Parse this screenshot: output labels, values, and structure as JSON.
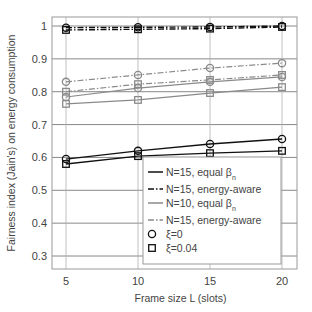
{
  "chart_data": {
    "type": "line",
    "title": "",
    "xlabel": "Frame size L (slots)",
    "ylabel": "Fairness index (Jain's) on energy consumption",
    "x": [
      5,
      10,
      15,
      20
    ],
    "xlim": [
      4,
      21
    ],
    "ylim": [
      0.26,
      1.03
    ],
    "xticks": [
      5,
      10,
      15,
      20
    ],
    "xtick_labels": [
      "5",
      "10",
      "15",
      "20"
    ],
    "yticks": [
      0.3,
      0.4,
      0.5,
      0.6,
      0.7,
      0.8,
      0.9,
      1.0
    ],
    "ytick_labels": [
      "0.3",
      "0.4",
      "0.5",
      "0.6",
      "0.7",
      "0.8",
      "0.9",
      "1"
    ],
    "grid": true,
    "legend_position": "bottom-right",
    "series": [
      {
        "name": "N=15, equal βn, ξ=0",
        "group": "N=15, equal βn",
        "marker": "circle",
        "color": "#111111",
        "dash": "solid",
        "values": [
          0.595,
          0.62,
          0.641,
          0.656
        ]
      },
      {
        "name": "N=15, equal βn, ξ=0.04",
        "group": "N=15, equal βn",
        "marker": "square",
        "color": "#111111",
        "dash": "solid",
        "values": [
          0.58,
          0.604,
          0.613,
          0.62
        ]
      },
      {
        "name": "N=15, energy-aware, ξ=0",
        "group": "N=15, energy-aware",
        "marker": "circle",
        "color": "#111111",
        "dash": "dashdot",
        "values": [
          0.995,
          0.996,
          0.997,
          1.0
        ]
      },
      {
        "name": "N=15, energy-aware, ξ=0.04",
        "group": "N=15, energy-aware",
        "marker": "square",
        "color": "#111111",
        "dash": "dashdot",
        "values": [
          0.988,
          0.99,
          0.992,
          0.997
        ]
      },
      {
        "name": "N=10, equal βn, ξ=0",
        "group": "N=10, equal βn",
        "marker": "circle",
        "color": "#8a8a8a",
        "dash": "solid",
        "values": [
          0.784,
          0.811,
          0.83,
          0.845
        ]
      },
      {
        "name": "N=10, equal βn, ξ=0.04",
        "group": "N=10, equal βn",
        "marker": "square",
        "color": "#8a8a8a",
        "dash": "solid",
        "values": [
          0.763,
          0.775,
          0.796,
          0.814
        ]
      },
      {
        "name": "N=15, energy-aware (gray), ξ=0",
        "group": "N=15, energy-aware (gray)",
        "marker": "circle",
        "color": "#8a8a8a",
        "dash": "dashdot",
        "values": [
          0.83,
          0.851,
          0.872,
          0.887
        ]
      },
      {
        "name": "N=15, energy-aware (gray), ξ=0.04",
        "group": "N=15, energy-aware (gray)",
        "marker": "square",
        "color": "#8a8a8a",
        "dash": "dashdot",
        "values": [
          0.8,
          0.823,
          0.836,
          0.851
        ]
      }
    ],
    "legend": [
      {
        "label": "N=15, equal β",
        "sub": "n",
        "kind": "line",
        "color": "#111111",
        "dash": "solid"
      },
      {
        "label": "N=15, energy-aware",
        "sub": "",
        "kind": "line",
        "color": "#111111",
        "dash": "dashdot"
      },
      {
        "label": "N=10, equal β",
        "sub": "n",
        "kind": "line",
        "color": "#8a8a8a",
        "dash": "solid"
      },
      {
        "label": "N=15, energy-aware",
        "sub": "",
        "kind": "line",
        "color": "#8a8a8a",
        "dash": "dashdot"
      },
      {
        "label": "ξ=0",
        "sub": "",
        "kind": "circle",
        "color": "#111111",
        "dash": ""
      },
      {
        "label": "ξ=0.04",
        "sub": "",
        "kind": "square",
        "color": "#111111",
        "dash": ""
      }
    ]
  }
}
